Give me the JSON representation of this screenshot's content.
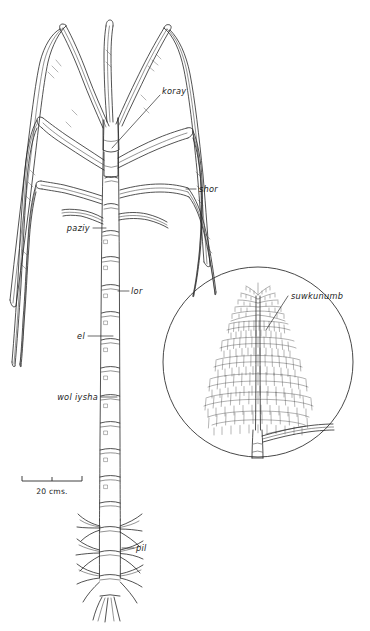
{
  "figure": {
    "background_color": "#ffffff",
    "ink_color": "#262626",
    "width": 370,
    "height": 631
  },
  "labels": {
    "koray": "koray",
    "shor": "shor",
    "paziy": "paziy",
    "lor": "lor",
    "el": "el",
    "wol_iysha": "wol iysha",
    "pil": "pil",
    "suwkunumb": "suwkunumb"
  },
  "scale": {
    "text": "20 cms.",
    "bar_length_px": 60,
    "ticks": 3
  },
  "inset": {
    "name": "inflorescence-detail",
    "shape": "circle",
    "center_x": 258,
    "center_y": 362,
    "radius": 95,
    "label": "suwkunumb"
  },
  "parts": [
    {
      "key": "koray",
      "label": "koray",
      "description": "upper leaf blade region at stem apex"
    },
    {
      "key": "shor",
      "label": "shor",
      "description": "long arching leaf blade"
    },
    {
      "key": "paziy",
      "label": "paziy",
      "description": "leaf sheath / upper stem node area"
    },
    {
      "key": "lor",
      "label": "lor",
      "description": "stem node"
    },
    {
      "key": "el",
      "label": "el",
      "description": "stem internode"
    },
    {
      "key": "wol_iysha",
      "label": "wol iysha",
      "description": "lower stem node"
    },
    {
      "key": "pil",
      "label": "pil",
      "description": "aerial prop roots at base"
    },
    {
      "key": "suwkunumb",
      "label": "suwkunumb",
      "description": "inflorescence / tassel in detail inset"
    }
  ]
}
